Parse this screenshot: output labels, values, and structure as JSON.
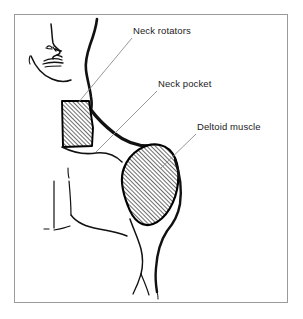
{
  "figure": {
    "background_color": "#ffffff",
    "frame": {
      "name": "figure-frame",
      "color": "#9a9a9a",
      "x": 14,
      "y": 14,
      "width": 274,
      "height": 289
    },
    "caption": ""
  },
  "labels": [
    {
      "id": "neck-rotators",
      "text": "Neck rotators",
      "color": "#1b1b1b",
      "x": 133,
      "y": 25
    },
    {
      "id": "neck-pocket",
      "text": "Neck pocket",
      "color": "#1b1b1b",
      "x": 158,
      "y": 78
    },
    {
      "id": "deltoid-muscle",
      "text": "Deltoid muscle",
      "color": "#1b1b1b",
      "x": 197,
      "y": 121
    }
  ],
  "leader_lines": [
    {
      "id": "leader-neck-rotators",
      "from": [
        132,
        38
      ],
      "to": [
        78,
        103
      ],
      "color": "#8d8d8d"
    },
    {
      "id": "leader-neck-pocket",
      "from": [
        157,
        91
      ],
      "to": [
        96,
        152
      ],
      "color": "#8d8d8d"
    },
    {
      "id": "leader-deltoid-muscle",
      "from": [
        196,
        134
      ],
      "to": [
        161,
        168
      ],
      "color": "#8d8d8d"
    }
  ],
  "regions": [
    {
      "id": "neck-rotators-region",
      "label": "Neck rotators",
      "shading": "diagonal-hatch",
      "outline_color": "#000000",
      "hatch_color": "#000000"
    },
    {
      "id": "deltoid-muscle-region",
      "label": "Deltoid muscle",
      "shading": "diagonal-hatch",
      "outline_color": "#000000",
      "hatch_color": "#000000"
    }
  ],
  "anatomy_parts": [
    {
      "id": "head-profile",
      "label": "Head profile outline"
    },
    {
      "id": "nose",
      "label": "Nose"
    },
    {
      "id": "nostril",
      "label": "Nostril"
    },
    {
      "id": "lips",
      "label": "Lips"
    },
    {
      "id": "chin-jaw",
      "label": "Chin and jaw line"
    },
    {
      "id": "neck-back-line",
      "label": "Posterior neck line"
    },
    {
      "id": "trapezius-line",
      "label": "Trapezius / shoulder slope"
    },
    {
      "id": "clavicle-line",
      "label": "Clavicle"
    },
    {
      "id": "pectoral-line",
      "label": "Pectoral contour"
    },
    {
      "id": "torso-line",
      "label": "Torso side contour"
    },
    {
      "id": "arm-line",
      "label": "Upper arm contour"
    },
    {
      "id": "sternum-line",
      "label": "Sternum / midline"
    }
  ]
}
